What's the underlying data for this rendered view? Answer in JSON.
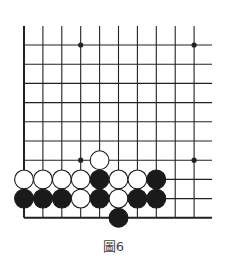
{
  "caption": "圖6",
  "board": {
    "origin_x": 24,
    "origin_y": 45,
    "spacing_x": 18.9,
    "spacing_y": 19.2,
    "cols": 10,
    "rows": 10,
    "right_extent": 212,
    "top_extent": 26,
    "hoshi": [
      [
        3,
        0
      ],
      [
        9,
        0
      ],
      [
        3,
        6
      ],
      [
        9,
        6
      ]
    ],
    "stones": [
      {
        "col": 4,
        "row": 6,
        "color": "white"
      },
      {
        "col": 0,
        "row": 7,
        "color": "white"
      },
      {
        "col": 1,
        "row": 7,
        "color": "white"
      },
      {
        "col": 2,
        "row": 7,
        "color": "white"
      },
      {
        "col": 3,
        "row": 7,
        "color": "white"
      },
      {
        "col": 4,
        "row": 7,
        "color": "black"
      },
      {
        "col": 5,
        "row": 7,
        "color": "white"
      },
      {
        "col": 6,
        "row": 7,
        "color": "white"
      },
      {
        "col": 7,
        "row": 7,
        "color": "black"
      },
      {
        "col": 0,
        "row": 8,
        "color": "black"
      },
      {
        "col": 1,
        "row": 8,
        "color": "black"
      },
      {
        "col": 2,
        "row": 8,
        "color": "black"
      },
      {
        "col": 3,
        "row": 8,
        "color": "white"
      },
      {
        "col": 4,
        "row": 8,
        "color": "black"
      },
      {
        "col": 5,
        "row": 8,
        "color": "white"
      },
      {
        "col": 6,
        "row": 8,
        "color": "black"
      },
      {
        "col": 7,
        "row": 8,
        "color": "black"
      },
      {
        "col": 5,
        "row": 9,
        "color": "black"
      }
    ],
    "colors": {
      "line": "#222222",
      "black_stone": "#1a1a1a",
      "white_stone": "#ffffff"
    }
  }
}
